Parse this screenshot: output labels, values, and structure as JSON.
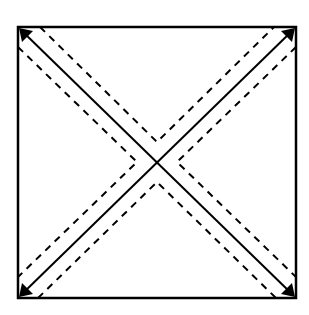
{
  "diagram": {
    "type": "folding-pattern",
    "colors": {
      "background": "#ffffff",
      "stroke": "#000000"
    },
    "square": {
      "x1": 18,
      "y1": 27,
      "x2": 296,
      "y2": 298
    },
    "center": {
      "x": 157,
      "y": 162
    },
    "solid_lines": [
      "diagonal-top-left-to-bottom-right",
      "diagonal-top-right-to-bottom-left"
    ],
    "dashed_chevrons": [
      "top",
      "right",
      "bottom",
      "left"
    ],
    "corner_arrows": [
      "top-left",
      "top-right",
      "bottom-left",
      "bottom-right"
    ]
  }
}
